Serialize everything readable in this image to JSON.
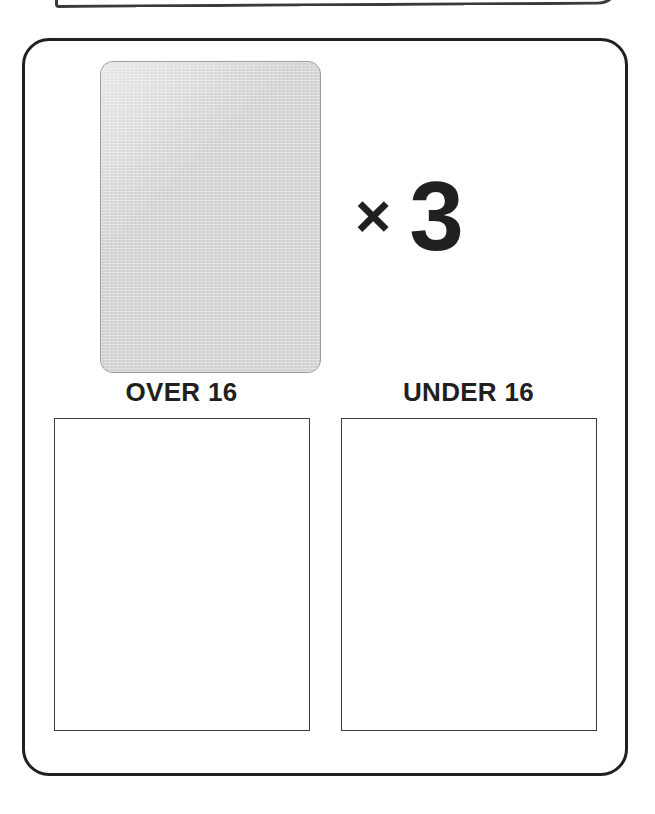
{
  "worksheet": {
    "partial_card_above": {
      "name": "cut-off-card-above"
    },
    "main_card": {
      "name": "activity-card"
    },
    "source_item": {
      "name": "blank-gray-card",
      "label": ""
    },
    "multiplier": {
      "symbol": "×",
      "count": "3"
    },
    "columns": [
      {
        "label": "OVER 16",
        "drop_zone_contents": ""
      },
      {
        "label": "UNDER 16",
        "drop_zone_contents": ""
      }
    ],
    "colors": {
      "card_border": "#221f1f",
      "gray_fill": "#d4d5d7",
      "gray_border": "#9a9b9d",
      "box_border": "#3c3c3c",
      "text": "#221f1f",
      "background": "#ffffff"
    }
  }
}
